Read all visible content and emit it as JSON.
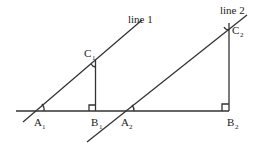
{
  "diagram": {
    "labels": {
      "line1": "line 1",
      "line2": "line 2",
      "A1": "A",
      "A1_sub": "1",
      "B1": "B",
      "B1_sub": "1",
      "C1": "C",
      "C1_sub": "1",
      "A2": "A",
      "A2_sub": "2",
      "B2": "B",
      "B2_sub": "2",
      "C2": "C",
      "C2_sub": "2"
    },
    "colors": {
      "stroke": "#333333",
      "text": "#222222"
    }
  }
}
